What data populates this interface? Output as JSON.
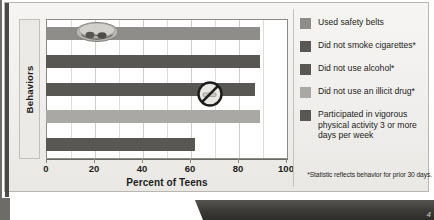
{
  "chart_data": {
    "type": "bar",
    "orientation": "horizontal",
    "title": "",
    "xlabel": "Percent of Teens",
    "ylabel": "Behaviors",
    "xlim": [
      0,
      100
    ],
    "xticks": [
      0,
      20,
      40,
      60,
      80,
      100
    ],
    "grid": true,
    "grid_axis": "x",
    "legend_position": "right",
    "categories": [
      "Used safety belts",
      "Did not smoke cigarettes*",
      "Did not use alcohol*",
      "Did not use an illicit drug*",
      "Participated in vigorous physical activity 3 or more days per week"
    ],
    "values": [
      89,
      89,
      87,
      89,
      62
    ],
    "colors": [
      "#8e8d8a",
      "#585754",
      "#585754",
      "#a9a8a4",
      "#585754"
    ],
    "footnote": "*Statistic reflects behavior for prior 30 days."
  },
  "axes": {
    "y_title": "Behaviors",
    "x_title": "Percent of Teens",
    "x_tick_labels": [
      "0",
      "20",
      "40",
      "60",
      "80",
      "100"
    ]
  },
  "legend": {
    "items": [
      {
        "label": "Used safety belts",
        "color": "#8e8d8a"
      },
      {
        "label": "Did not smoke cigarettes*",
        "color": "#585754"
      },
      {
        "label": "Did not use alcohol*",
        "color": "#585754"
      },
      {
        "label": "Did not use an illicit drug*",
        "color": "#a9a8a4"
      },
      {
        "label": "Participated in vigorous physical activity 3 or more days per week",
        "color": "#585754"
      }
    ]
  },
  "footnote": "*Statistic reflects behavior for prior 30 days.",
  "overlays": [
    {
      "name": "sunglasses-photo"
    },
    {
      "name": "no-smoking-sign-photo"
    }
  ],
  "banner": {
    "mark": "4"
  }
}
